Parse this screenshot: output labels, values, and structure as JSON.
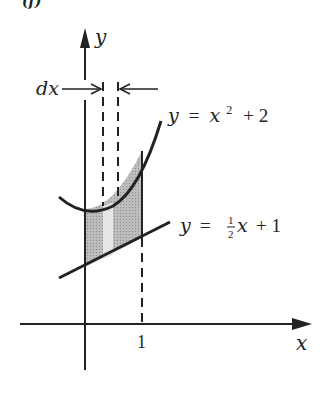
{
  "figure": {
    "panel_label": "(f)",
    "axes": {
      "x_label": "x",
      "y_label": "y",
      "x_tick": "1"
    },
    "curves": [
      {
        "name": "upper",
        "equation_lhs": "y",
        "equation_eq": "=",
        "equation_rhs": "x",
        "exponent": "2",
        "tail": "+ 2"
      },
      {
        "name": "lower",
        "equation_lhs": "y",
        "equation_eq": "=",
        "frac_num": "1",
        "frac_den": "2",
        "var": "x",
        "tail": "+ 1"
      }
    ],
    "strip_label": "dx",
    "colors": {
      "ink": "#222222",
      "shade": "#b5b5b5",
      "strip": "#e2e2e2"
    }
  }
}
